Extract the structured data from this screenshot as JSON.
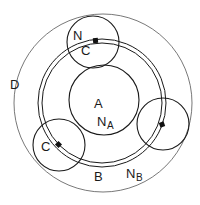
{
  "diagram": {
    "labels": {
      "outer": "D",
      "ring": "B",
      "ring_sub_main": "N",
      "ring_sub": "B",
      "center_main": "A",
      "center_sub_main": "N",
      "center_sub": "A",
      "top_circle": "N",
      "top_contact": "C",
      "left_contact": "C"
    },
    "colors": {
      "stroke": "#1a1a1a",
      "thin_stroke": "#555555",
      "contact": "#111111",
      "background": "#ffffff"
    }
  }
}
